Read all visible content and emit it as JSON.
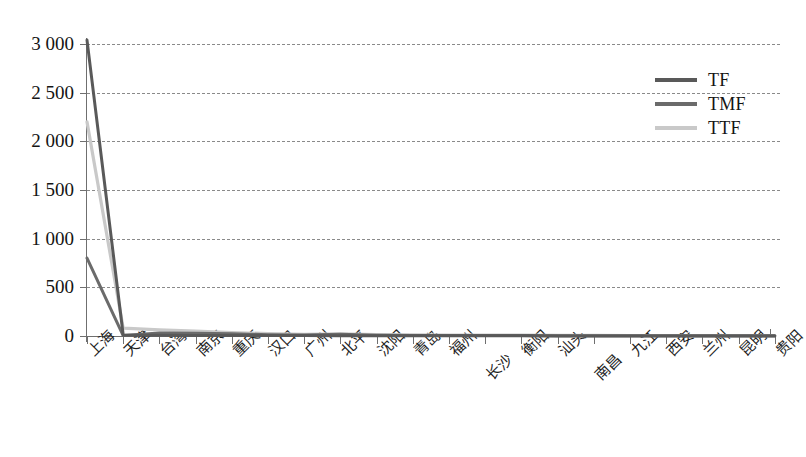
{
  "chart_data": {
    "type": "line",
    "title": "",
    "xlabel": "",
    "ylabel": "",
    "ylim": [
      0,
      3000
    ],
    "yticks": [
      0,
      500,
      1000,
      1500,
      2000,
      2500,
      3000
    ],
    "ytick_labels": [
      "0",
      "500",
      "1 000",
      "1 500",
      "2 000",
      "2 500",
      "3 000"
    ],
    "grid": true,
    "legend_position": "upper right",
    "categories": [
      "上海",
      "天津",
      "台湾",
      "南京",
      "重庆",
      "汉口",
      "广州",
      "北平",
      "沈阳",
      "青岛",
      "福州",
      "长沙",
      "衡阳",
      "汕头",
      "南昌",
      "九江",
      "西安",
      "兰州",
      "昆明",
      "贵阳"
    ],
    "series": [
      {
        "name": "TF",
        "color": "#595959",
        "values": [
          3040,
          10,
          8,
          6,
          5,
          4,
          4,
          3,
          3,
          2,
          2,
          2,
          2,
          1,
          1,
          1,
          1,
          1,
          1,
          1
        ]
      },
      {
        "name": "TMF",
        "color": "#6b6b6b",
        "values": [
          800,
          5,
          30,
          28,
          22,
          14,
          10,
          18,
          8,
          6,
          5,
          4,
          4,
          3,
          3,
          2,
          2,
          2,
          2,
          2
        ]
      },
      {
        "name": "TTF",
        "color": "#c9c9c9",
        "values": [
          2200,
          80,
          62,
          50,
          36,
          24,
          18,
          22,
          14,
          12,
          10,
          9,
          8,
          7,
          6,
          5,
          5,
          4,
          4,
          4
        ]
      }
    ]
  },
  "legend": {
    "entries": [
      {
        "label": "TF",
        "color": "#595959"
      },
      {
        "label": "TMF",
        "color": "#6b6b6b"
      },
      {
        "label": "TTF",
        "color": "#c9c9c9"
      }
    ]
  },
  "axis": {
    "y_tick_labels": [
      "3 000",
      "2 500",
      "2 000",
      "1 500",
      "1 000",
      "500",
      "0"
    ],
    "x_tick_labels": [
      "上海",
      "天津",
      "台湾",
      "南京",
      "重庆",
      "汉口",
      "广州",
      "北平",
      "沈阳",
      "青岛",
      "福州",
      "长沙",
      "衡阳",
      "汕头",
      "南昌",
      "九江",
      "西安",
      "兰州",
      "昆明",
      "贵阳"
    ]
  },
  "colors": {
    "axis": "#6f6f6f",
    "grid": "#8a8a8a",
    "background": "#ffffff"
  }
}
